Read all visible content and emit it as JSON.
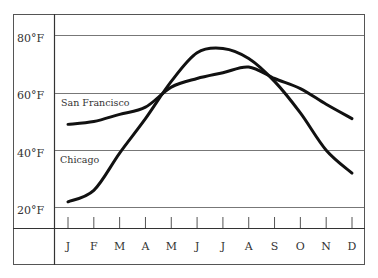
{
  "chart_data": {
    "type": "line",
    "title": "",
    "xlabel": "",
    "ylabel": "",
    "categories": [
      "J",
      "F",
      "M",
      "A",
      "M",
      "J",
      "J",
      "A",
      "S",
      "O",
      "N",
      "D"
    ],
    "series": [
      {
        "name": "San Francisco",
        "values": [
          49,
          50,
          52.5,
          55,
          62,
          65,
          67,
          69,
          65,
          61.5,
          56,
          51
        ],
        "color": "#111111"
      },
      {
        "name": "Chicago",
        "values": [
          22,
          26,
          39,
          51,
          64,
          74,
          75.5,
          72,
          64,
          53,
          40,
          32
        ],
        "color": "#111111"
      }
    ],
    "yticks": [
      "20°F",
      "40°F",
      "60°F",
      "80°F"
    ],
    "ytick_values": [
      20,
      40,
      60,
      80
    ],
    "ylim": [
      13,
      87
    ],
    "grid": true,
    "legend": "inline labels"
  },
  "labels": {
    "y80": "80°F",
    "y60": "60°F",
    "y40": "40°F",
    "y20": "20°F",
    "series_sf": "San Francisco",
    "series_chicago": "Chicago",
    "months": [
      "J",
      "F",
      "M",
      "A",
      "M",
      "J",
      "J",
      "A",
      "S",
      "O",
      "N",
      "D"
    ]
  },
  "colors": {
    "frame": "#555555",
    "grid": "#777777",
    "line": "#111111"
  }
}
